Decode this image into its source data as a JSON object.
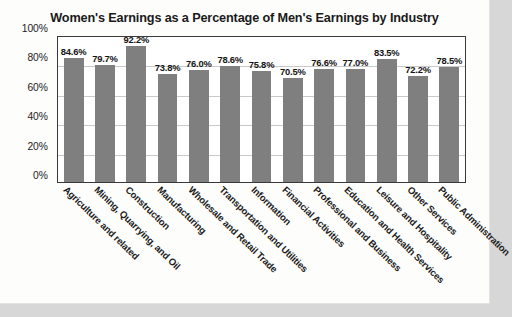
{
  "chart_data": {
    "type": "bar",
    "title": "Women's Earnings as a Percentage of Men's Earnings by Industry",
    "xlabel": "",
    "ylabel": "",
    "ylim": [
      0,
      100
    ],
    "yticks": [
      "0%",
      "20%",
      "40%",
      "60%",
      "80%",
      "100%"
    ],
    "grid": true,
    "legend": "none",
    "bar_color": "#7f7f7f",
    "categories": [
      "Agriculture and related",
      "Mining, Quarrying, and Oil",
      "Construction",
      "Manufacturing",
      "Wholesale and Retail Trade",
      "Transportation and Utilities",
      "Information",
      "Financial Activities",
      "Professional and Business",
      "Education and Health Services",
      "Leisure and Hospitality",
      "Other Services",
      "Public Administration"
    ],
    "values": [
      84.6,
      79.7,
      92.2,
      73.8,
      76.0,
      78.6,
      75.8,
      70.5,
      76.6,
      77.0,
      83.5,
      72.2,
      78.5
    ],
    "value_labels": [
      "84.6%",
      "79.7%",
      "92.2%",
      "73.8%",
      "76.0%",
      "78.6%",
      "75.8%",
      "70.5%",
      "76.6%",
      "77.0%",
      "83.5%",
      "72.2%",
      "78.5%"
    ]
  }
}
